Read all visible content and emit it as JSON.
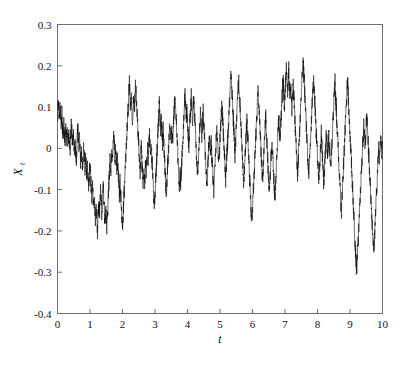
{
  "figure": {
    "background_color": "#ffffff",
    "frame_color": "#6e6e6e",
    "line_color": "#111111"
  },
  "axis": {
    "y_label_main": "X",
    "y_label_sub": "t",
    "x_label": "t",
    "y_ticks": [
      "0.3",
      "0.2",
      "0.1",
      "0",
      "-0.1",
      "-0.2",
      "-0.3",
      "-0.4"
    ],
    "x_ticks": [
      "0",
      "1",
      "2",
      "3",
      "4",
      "5",
      "6",
      "7",
      "8",
      "9",
      "10"
    ]
  },
  "chart_data": {
    "type": "line",
    "title": "",
    "subtitle": "",
    "xlabel": "t",
    "ylabel": "X_t",
    "xlim": [
      0,
      10
    ],
    "ylim": [
      -0.4,
      0.3
    ],
    "grid": false,
    "legend": null,
    "xticks": [
      0,
      1,
      2,
      3,
      4,
      5,
      6,
      7,
      8,
      9,
      10
    ],
    "yticks": [
      -0.4,
      -0.3,
      -0.2,
      -0.1,
      0,
      0.1,
      0.2,
      0.3
    ],
    "series": [
      {
        "name": "X_t",
        "color": "#111111",
        "linewidth": 0.6,
        "n_points": 501,
        "x_start": 0,
        "x_end": 10,
        "x_step": 0.02,
        "values": [
          0.075,
          0.118,
          0.092,
          0.061,
          0.1,
          0.072,
          0.045,
          0.083,
          0.05,
          0.031,
          0.064,
          0.038,
          0.012,
          0.047,
          0.02,
          0.052,
          0.025,
          0.004,
          0.038,
          0.012,
          -0.011,
          0.022,
          0.066,
          0.035,
          0.008,
          0.041,
          0.015,
          -0.018,
          0.014,
          -0.009,
          -0.033,
          0.002,
          0.058,
          0.028,
          -0.002,
          0.03,
          -0.005,
          -0.036,
          -0.001,
          -0.028,
          -0.058,
          -0.021,
          0.01,
          -0.02,
          -0.05,
          -0.015,
          -0.045,
          -0.075,
          -0.038,
          -0.068,
          -0.1,
          -0.062,
          -0.03,
          -0.062,
          -0.095,
          -0.125,
          -0.088,
          -0.12,
          -0.152,
          -0.118,
          -0.15,
          -0.18,
          -0.145,
          -0.175,
          -0.199,
          -0.16,
          -0.128,
          -0.162,
          -0.13,
          -0.098,
          -0.13,
          -0.16,
          -0.125,
          -0.093,
          -0.125,
          -0.155,
          -0.185,
          -0.15,
          -0.18,
          -0.198,
          -0.162,
          -0.128,
          -0.095,
          -0.062,
          -0.03,
          -0.062,
          -0.032,
          0.001,
          -0.03,
          0.002,
          0.034,
          0.002,
          -0.028,
          0.005,
          -0.025,
          -0.055,
          -0.022,
          -0.052,
          -0.082,
          -0.112,
          -0.078,
          -0.108,
          -0.14,
          -0.172,
          -0.196,
          -0.16,
          -0.128,
          -0.095,
          -0.06,
          -0.028,
          0.004,
          0.036,
          0.068,
          0.1,
          0.132,
          0.16,
          0.128,
          0.1,
          0.13,
          0.098,
          0.066,
          0.1,
          0.132,
          0.098,
          0.128,
          0.166,
          0.13,
          0.098,
          0.066,
          0.034,
          0.002,
          -0.03,
          -0.062,
          -0.03,
          0.002,
          -0.03,
          -0.062,
          -0.092,
          -0.06,
          -0.09,
          -0.06,
          -0.03,
          -0.06,
          -0.03,
          0.002,
          -0.028,
          0.004,
          0.036,
          0.004,
          -0.026,
          0.006,
          -0.024,
          -0.054,
          -0.086,
          -0.116,
          -0.145,
          -0.112,
          -0.08,
          -0.048,
          -0.016,
          0.016,
          0.048,
          0.08,
          0.112,
          0.078,
          0.046,
          0.078,
          0.046,
          0.014,
          0.046,
          0.014,
          -0.018,
          -0.05,
          -0.082,
          -0.114,
          -0.082,
          -0.05,
          -0.018,
          0.014,
          0.046,
          0.03,
          0.042,
          0.025,
          0.04,
          0.022,
          0.042,
          0.07,
          0.1,
          0.128,
          0.096,
          0.064,
          0.032,
          0.0,
          -0.032,
          -0.064,
          -0.096,
          -0.06,
          -0.09,
          -0.058,
          -0.026,
          0.006,
          0.038,
          0.07,
          0.102,
          0.13,
          0.098,
          0.066,
          0.098,
          0.066,
          0.034,
          0.002,
          0.034,
          0.066,
          0.098,
          0.126,
          0.094,
          0.062,
          0.094,
          0.126,
          0.094,
          0.062,
          0.03,
          -0.002,
          -0.034,
          -0.066,
          -0.034,
          -0.002,
          0.03,
          0.062,
          0.094,
          0.06,
          0.028,
          0.058,
          0.09,
          0.06,
          0.03,
          0.0,
          -0.03,
          -0.06,
          -0.09,
          -0.058,
          -0.026,
          0.006,
          0.038,
          0.012,
          -0.018,
          0.014,
          -0.016,
          -0.046,
          -0.076,
          -0.106,
          -0.074,
          -0.042,
          -0.01,
          0.022,
          0.054,
          0.022,
          -0.01,
          -0.042,
          -0.012,
          0.02,
          0.052,
          0.084,
          0.115,
          0.082,
          0.05,
          0.018,
          -0.014,
          -0.046,
          -0.078,
          -0.048,
          -0.018,
          0.012,
          0.042,
          0.074,
          0.106,
          0.138,
          0.17,
          0.178,
          0.145,
          0.112,
          0.08,
          0.048,
          0.016,
          -0.016,
          0.016,
          0.048,
          0.08,
          0.112,
          0.144,
          0.168,
          0.135,
          0.102,
          0.07,
          0.038,
          0.006,
          -0.026,
          -0.058,
          -0.09,
          -0.058,
          -0.026,
          0.006,
          0.038,
          0.07,
          0.038,
          0.006,
          -0.026,
          -0.058,
          -0.09,
          -0.122,
          -0.154,
          -0.178,
          -0.145,
          -0.112,
          -0.08,
          -0.048,
          -0.016,
          0.016,
          0.048,
          0.08,
          0.112,
          0.144,
          0.112,
          0.08,
          0.048,
          0.016,
          -0.016,
          -0.048,
          -0.08,
          -0.048,
          -0.016,
          0.016,
          0.048,
          0.08,
          0.048,
          0.016,
          -0.016,
          -0.048,
          -0.08,
          -0.11,
          -0.078,
          -0.046,
          -0.014,
          0.018,
          -0.012,
          -0.042,
          -0.072,
          -0.102,
          -0.115,
          -0.082,
          -0.05,
          -0.018,
          0.014,
          0.046,
          0.078,
          0.046,
          0.014,
          0.046,
          0.078,
          0.11,
          0.142,
          0.168,
          0.135,
          0.102,
          0.135,
          0.165,
          0.195,
          0.162,
          0.13,
          0.16,
          0.19,
          0.158,
          0.126,
          0.158,
          0.128,
          0.098,
          0.128,
          0.158,
          0.126,
          0.094,
          0.062,
          0.03,
          -0.002,
          -0.034,
          -0.066,
          -0.034,
          -0.002,
          0.03,
          0.062,
          0.094,
          0.126,
          0.158,
          0.19,
          0.218,
          0.186,
          0.154,
          0.122,
          0.09,
          0.058,
          0.026,
          -0.006,
          -0.038,
          -0.068,
          -0.036,
          -0.004,
          0.028,
          0.06,
          0.092,
          0.124,
          0.156,
          0.168,
          0.136,
          0.104,
          0.072,
          0.04,
          0.008,
          -0.024,
          -0.056,
          -0.088,
          -0.056,
          -0.024,
          0.008,
          0.04,
          0.008,
          -0.024,
          -0.056,
          -0.088,
          -0.056,
          -0.024,
          0.008,
          0.04,
          0.012,
          -0.018,
          0.012,
          0.042,
          0.012,
          -0.018,
          -0.048,
          -0.018,
          0.012,
          0.042,
          0.072,
          0.102,
          0.132,
          0.162,
          0.13,
          0.098,
          0.066,
          0.034,
          0.002,
          -0.03,
          -0.062,
          -0.094,
          -0.126,
          -0.156,
          -0.124,
          -0.092,
          -0.06,
          -0.028,
          0.004,
          0.036,
          0.068,
          0.1,
          0.132,
          0.164,
          0.132,
          0.1,
          0.068,
          0.036,
          0.004,
          -0.028,
          -0.06,
          -0.092,
          -0.124,
          -0.156,
          -0.188,
          -0.22,
          -0.252,
          -0.284,
          -0.29,
          -0.258,
          -0.226,
          -0.194,
          -0.162,
          -0.13,
          -0.098,
          -0.066,
          -0.034,
          -0.002,
          0.03,
          0.062,
          0.03,
          -0.002,
          0.028,
          0.058,
          0.075,
          0.045,
          0.015,
          -0.015,
          -0.045,
          -0.075,
          -0.105,
          -0.135,
          -0.165,
          -0.195,
          -0.225,
          -0.25,
          -0.218,
          -0.186,
          -0.154,
          -0.122,
          -0.09,
          -0.058,
          -0.026,
          0.006,
          -0.024,
          0.006,
          0.036,
          0.01,
          -0.02,
          0.012
        ]
      }
    ]
  }
}
